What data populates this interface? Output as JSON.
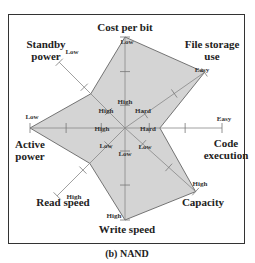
{
  "chart_data": {
    "type": "radar",
    "caption": "(b) NAND",
    "scale_levels": 3,
    "polygon_fill": "#d4d4d4",
    "axes": [
      {
        "id": "cost",
        "name": "Cost per bit",
        "lines": [
          "Cost per bit"
        ],
        "inner": "High",
        "outer": "Low",
        "value": 1.0
      },
      {
        "id": "file",
        "name": "File storage use",
        "lines": [
          "File storage",
          "use"
        ],
        "inner": "Hard",
        "outer": "Easy",
        "value": 1.0
      },
      {
        "id": "code",
        "name": "Code execution",
        "lines": [
          "Code",
          "execution"
        ],
        "inner": "Hard",
        "outer": "Easy",
        "value": 0.36
      },
      {
        "id": "capacity",
        "name": "Capacity",
        "lines": [
          "Capacity"
        ],
        "inner": "Low",
        "outer": "High",
        "value": 1.0
      },
      {
        "id": "write",
        "name": "Write speed",
        "lines": [
          "Write speed"
        ],
        "inner": "Low",
        "outer": "High",
        "value": 1.0
      },
      {
        "id": "read",
        "name": "Read speed",
        "lines": [
          "Read speed"
        ],
        "inner": "Low",
        "outer": "High",
        "value": 0.52
      },
      {
        "id": "active",
        "name": "Active power",
        "lines": [
          "Active",
          "power"
        ],
        "inner": "High",
        "outer": "Low",
        "value": 1.0
      },
      {
        "id": "standby",
        "name": "Standby power",
        "lines": [
          "Standby",
          "power"
        ],
        "inner": "High",
        "outer": "Low",
        "value": 0.52
      }
    ]
  }
}
